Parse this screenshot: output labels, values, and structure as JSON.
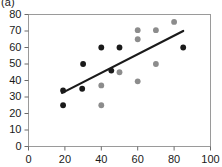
{
  "panel": {
    "label": "(a)"
  },
  "chart_data": {
    "type": "scatter",
    "title": "",
    "xlabel": "",
    "ylabel": "",
    "xlim": [
      0,
      100
    ],
    "ylim": [
      0,
      80
    ],
    "xticks": [
      0,
      20,
      40,
      60,
      80,
      100
    ],
    "yticks": [
      0,
      10,
      20,
      30,
      40,
      50,
      60,
      70,
      80
    ],
    "grid": false,
    "legend": "none",
    "frame": true,
    "series": [
      {
        "name": "black-points",
        "color": "#1a1a1a",
        "marker": "filled-circle",
        "points": [
          [
            19,
            25
          ],
          [
            19,
            34
          ],
          [
            29.5,
            35
          ],
          [
            30,
            50
          ],
          [
            40,
            60
          ],
          [
            45.5,
            46
          ],
          [
            50,
            60
          ],
          [
            85,
            60
          ]
        ]
      },
      {
        "name": "gray-points",
        "color": "#8c8c8c",
        "marker": "filled-circle",
        "points": [
          [
            40,
            25
          ],
          [
            40,
            37
          ],
          [
            50,
            45
          ],
          [
            60,
            39.5
          ],
          [
            60,
            65
          ],
          [
            60,
            70.5
          ],
          [
            70,
            50
          ],
          [
            70,
            70.5
          ],
          [
            80,
            75.5
          ]
        ]
      }
    ],
    "trendline": {
      "name": "regression-line",
      "color": "#1a1a1a",
      "x_start": 18.5,
      "y_start": 32.5,
      "x_end": 85,
      "y_end": 70
    }
  }
}
